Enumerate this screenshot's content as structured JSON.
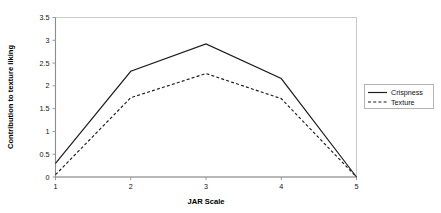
{
  "chart_data": {
    "type": "line",
    "title": "",
    "xlabel": "JAR Scale",
    "ylabel": "Contribution to texture liking",
    "x": [
      1,
      2,
      3,
      4,
      5
    ],
    "categories": [
      "1",
      "2",
      "3",
      "4",
      "5"
    ],
    "xlim": [
      1,
      5
    ],
    "ylim": [
      0,
      3.5
    ],
    "xticks": [
      "1",
      "2",
      "3",
      "4",
      "5"
    ],
    "yticks": [
      "0",
      "0.5",
      "1",
      "1.5",
      "2",
      "2.5",
      "3",
      "3.5"
    ],
    "ytick_values": [
      0,
      0.5,
      1,
      1.5,
      2,
      2.5,
      3,
      3.5
    ],
    "grid": false,
    "legend_position": "right-outside",
    "series": [
      {
        "name": "Crispness",
        "style": "solid",
        "color": "#1a1a1a",
        "values": [
          0.3,
          2.32,
          2.92,
          2.16,
          0
        ]
      },
      {
        "name": "Texture",
        "style": "dashed",
        "color": "#1a1a1a",
        "values": [
          0.05,
          1.74,
          2.27,
          1.72,
          0
        ]
      }
    ]
  },
  "legend": {
    "items": [
      {
        "label": "Crispness",
        "style": "solid"
      },
      {
        "label": "Texture",
        "style": "dashed"
      }
    ]
  },
  "axes": {
    "x_title": "JAR Scale",
    "y_title": "Contribution to texture liking",
    "x_tick_labels": [
      "1",
      "2",
      "3",
      "4",
      "5"
    ],
    "y_tick_labels": [
      "0",
      "0.5",
      "1",
      "1.5",
      "2",
      "2.5",
      "3",
      "3.5"
    ]
  },
  "colors": {
    "line": "#1a1a1a",
    "axis": "#9a9a9a",
    "plot_border": "#c8c8c8",
    "text": "#111111",
    "background": "#ffffff"
  }
}
